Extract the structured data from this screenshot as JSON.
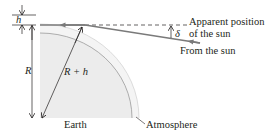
{
  "diagram": {
    "type": "atmospheric-refraction",
    "labels": {
      "h": "h",
      "R": "R",
      "R_plus_h": "R + h",
      "delta": "δ",
      "apparent_position_line1": "Apparent position",
      "apparent_position_line2": "of the sun",
      "from_sun": "From the sun",
      "earth": "Earth",
      "atmosphere": "Atmosphere"
    },
    "colors": {
      "earth_fill": "#ececec",
      "atmosphere_fill": "#f4f4f4",
      "ray": "#7a7a7a",
      "line": "#231f20",
      "arc": "#8a8a8a"
    }
  }
}
